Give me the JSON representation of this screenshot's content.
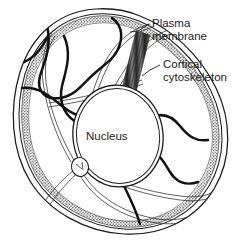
{
  "figure": {
    "background_color": "#ffffff",
    "ink_color": "#1c1c1c",
    "filament_color": "#111111",
    "cortex_color": "#6b6b6b",
    "bundle_color": "#4a4a4a"
  },
  "labels": {
    "plasma_membrane": {
      "line1": "Plasma",
      "line2": "membrane"
    },
    "cortical_cytoskeleton": {
      "line1": "Cortical",
      "line2": "cytoskeleton"
    },
    "nucleus": "Nucleus"
  },
  "structures": [
    {
      "name": "plasma-membrane",
      "description": "Outer double-line boundary of the cell"
    },
    {
      "name": "cortical-cytoskeleton",
      "description": "Stippled band just inside the plasma membrane"
    },
    {
      "name": "nucleus",
      "description": "Large double-outlined oval in the cell centre"
    },
    {
      "name": "centrosome",
      "description": "Small circle lower-left of the nucleus where microtubules converge"
    },
    {
      "name": "stress-fiber-bundle",
      "description": "Dark striated bundle from upper membrane to nucleus"
    },
    {
      "name": "actin-filaments",
      "description": "Thick dark wavy filaments through the cytoplasm"
    },
    {
      "name": "microtubules",
      "description": "Thin paired-line tracks radiating from the centrosome"
    }
  ]
}
